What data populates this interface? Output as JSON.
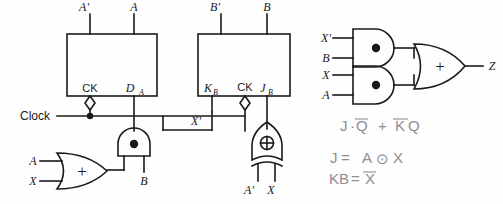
{
  "figure": {
    "type": "logic-circuit-diagram",
    "background_color": "#fefefe",
    "line_color": "#1a1a1a",
    "handwriting_color": "#8d8d92"
  },
  "flipflop_a": {
    "name": "D flip-flop A",
    "output_qprime": "A'",
    "output_q": "A",
    "clock_label": "CK",
    "data_label": "D",
    "data_sub": "A"
  },
  "flipflop_b": {
    "name": "JK flip-flop B",
    "output_qprime": "B'",
    "output_q": "B",
    "clock_label": "CK",
    "k_label": "K",
    "k_sub": "B",
    "j_label": "J",
    "j_sub": "B",
    "k_input": "X'"
  },
  "clock": {
    "label": "Clock"
  },
  "and_gate_da": {
    "name": "and-gate-feeding-da",
    "symbol": "●",
    "input_right": "B"
  },
  "or_gate_ax": {
    "name": "or-gate-a-x",
    "symbol": "+",
    "input_top": "A",
    "input_bottom": "X"
  },
  "xor_gate_jb": {
    "name": "xor-gate-feeding-jb",
    "symbol": "⊕",
    "input_left": "A'",
    "input_right": "X"
  },
  "output_logic": {
    "and_top": {
      "symbol": "●",
      "input_top": "X'",
      "input_bottom": "B"
    },
    "and_bottom": {
      "symbol": "●",
      "input_top": "X",
      "input_bottom": "A"
    },
    "or_gate": {
      "symbol": "+",
      "output": "Z"
    }
  },
  "notes": {
    "line1_a": "J",
    "line1_b": "·",
    "line1_c": "Q",
    "line1_d": "+",
    "line1_e": "K",
    "line1_f": "Q",
    "line1_text": "J·Q̄ + K̄Q",
    "line2_text": "J = A ⊙ X",
    "line2_a": "J",
    "line2_b": "=",
    "line2_c": "A",
    "line2_d": "⊙",
    "line2_e": "X",
    "line3_text": "KB = X̄",
    "line3_a": "KB",
    "line3_b": "=",
    "line3_c": "X"
  }
}
